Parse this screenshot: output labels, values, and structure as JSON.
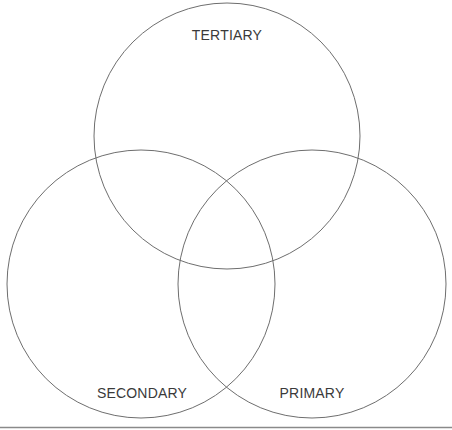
{
  "diagram": {
    "type": "venn",
    "line_color": "#6e6e6e",
    "text_color": "#3a3a3a",
    "baseline_color": "#8a8a8a",
    "sets": [
      {
        "id": "tertiary",
        "label": "TERTIARY",
        "cx": 227,
        "cy": 136,
        "r": 133
      },
      {
        "id": "secondary",
        "label": "SECONDARY",
        "cx": 141,
        "cy": 284,
        "r": 134
      },
      {
        "id": "primary",
        "label": "PRIMARY",
        "cx": 312,
        "cy": 284,
        "r": 134
      }
    ]
  }
}
